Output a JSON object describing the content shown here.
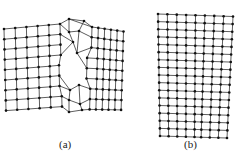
{
  "figure": {
    "panels": [
      {
        "id": "a",
        "label": "(a)",
        "description": "Mesh with a dislocation / slip defect in the middle"
      },
      {
        "id": "b",
        "label": "(b)",
        "description": "Mesh with curved (fan-shaped) lattice bending"
      }
    ],
    "colors": {
      "line": "#333333",
      "node": "#111111",
      "background": "#ffffff",
      "caption": "#222222"
    }
  }
}
